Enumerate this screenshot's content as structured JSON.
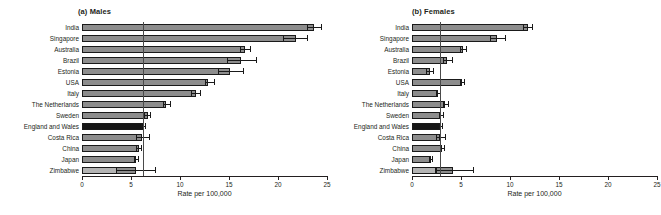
{
  "figure": {
    "xlabel": "Rate per 100,000"
  },
  "panels": [
    {
      "id": "males",
      "title": "(a) Males",
      "xlabel": "Rate per 100,000"
    },
    {
      "id": "females",
      "title": "(b) Females",
      "xlabel": "Rate per 100,000"
    }
  ],
  "axis": {
    "ticks": [
      0,
      5,
      10,
      15,
      20,
      25
    ],
    "tick_labels": [
      "0",
      "5",
      "10",
      "15",
      "20",
      "25"
    ],
    "xlim": [
      0,
      25
    ]
  },
  "chart_data": [
    {
      "type": "bar",
      "orientation": "horizontal",
      "title": "(a) Males",
      "xlabel": "Rate per 100,000",
      "ylabel": "",
      "xlim": [
        0,
        25
      ],
      "xticks": [
        0,
        5,
        10,
        15,
        20,
        25
      ],
      "grid": false,
      "legend": "none",
      "reference_line": 6.2,
      "highlight_category": "England and Wales",
      "categories": [
        "India",
        "Singapore",
        "Australia",
        "Brazil",
        "Estonia",
        "USA",
        "Italy",
        "The Netherlands",
        "Sweden",
        "England and Wales",
        "Costa Rica",
        "China",
        "Japan",
        "Zimbabwe"
      ],
      "values": [
        23.7,
        21.8,
        16.6,
        16.2,
        15.1,
        12.9,
        11.6,
        8.6,
        6.7,
        6.3,
        6.1,
        5.8,
        5.5,
        5.5
      ],
      "ci_low": [
        23.0,
        20.6,
        16.2,
        14.8,
        13.9,
        12.6,
        11.2,
        8.3,
        6.4,
        6.1,
        5.6,
        5.5,
        5.3,
        3.5
      ],
      "ci_high": [
        24.4,
        23.0,
        17.2,
        17.8,
        16.5,
        13.5,
        12.1,
        9.0,
        7.0,
        6.5,
        6.9,
        6.1,
        5.8,
        7.5
      ],
      "inner_segment": {
        "category": "Zimbabwe",
        "value": 3.5
      }
    },
    {
      "type": "bar",
      "orientation": "horizontal",
      "title": "(b) Females",
      "xlabel": "Rate per 100,000",
      "ylabel": "",
      "xlim": [
        0,
        25
      ],
      "xticks": [
        0,
        5,
        10,
        15,
        20,
        25
      ],
      "grid": false,
      "legend": "none",
      "reference_line": 2.9,
      "highlight_category": "England and Wales",
      "categories": [
        "India",
        "Singapore",
        "Australia",
        "Brazil",
        "Estonia",
        "USA",
        "Italy",
        "The Netherlands",
        "Sweden",
        "England and Wales",
        "Costa Rica",
        "China",
        "Japan",
        "Zimbabwe"
      ],
      "values": [
        11.8,
        8.7,
        5.2,
        3.6,
        1.8,
        5.1,
        2.7,
        3.4,
        3.0,
        2.9,
        2.9,
        3.1,
        1.9,
        4.2
      ],
      "ci_low": [
        11.4,
        8.0,
        4.9,
        3.2,
        1.5,
        4.9,
        2.5,
        3.2,
        2.8,
        2.8,
        2.5,
        2.9,
        1.8,
        2.4
      ],
      "ci_high": [
        12.3,
        9.5,
        5.5,
        4.1,
        2.2,
        5.3,
        2.9,
        3.7,
        3.2,
        3.1,
        3.4,
        3.3,
        2.1,
        6.3
      ],
      "inner_segment": {
        "category": "Zimbabwe",
        "value": 2.4
      }
    }
  ]
}
